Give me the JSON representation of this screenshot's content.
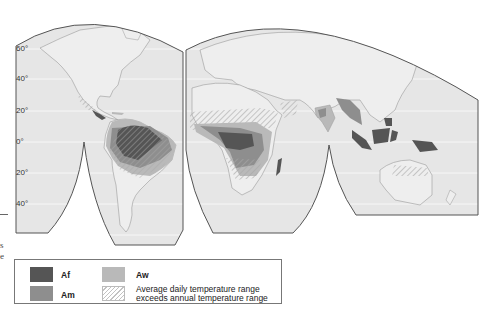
{
  "map": {
    "title": "Tropical humid climates world map",
    "latitude_labels": [
      {
        "label": "60°",
        "y": 45
      },
      {
        "label": "40°",
        "y": 75
      },
      {
        "label": "20°",
        "y": 107
      },
      {
        "label": "0°",
        "y": 138
      },
      {
        "label": "20°",
        "y": 169
      },
      {
        "label": "40°",
        "y": 200
      }
    ],
    "colors": {
      "ocean": "#e6e6e6",
      "land": "#eeeeee",
      "coastline": "#9a9a9a",
      "graticule": "#f7f7f7",
      "outline": "#555555",
      "Af": "#555555",
      "Am": "#8e8e8e",
      "Aw": "#b9b9b9",
      "hatch": "#a8a8a8"
    }
  },
  "margin_fragments": [
    "s",
    "e"
  ],
  "legend": {
    "items": [
      {
        "key": "Af",
        "label": "Af"
      },
      {
        "key": "Am",
        "label": "Am"
      },
      {
        "key": "Aw",
        "label": "Aw"
      },
      {
        "key": "hatch",
        "label_line1": "Average daily temperature range",
        "label_line2": "exceeds annual temperature range"
      }
    ]
  }
}
